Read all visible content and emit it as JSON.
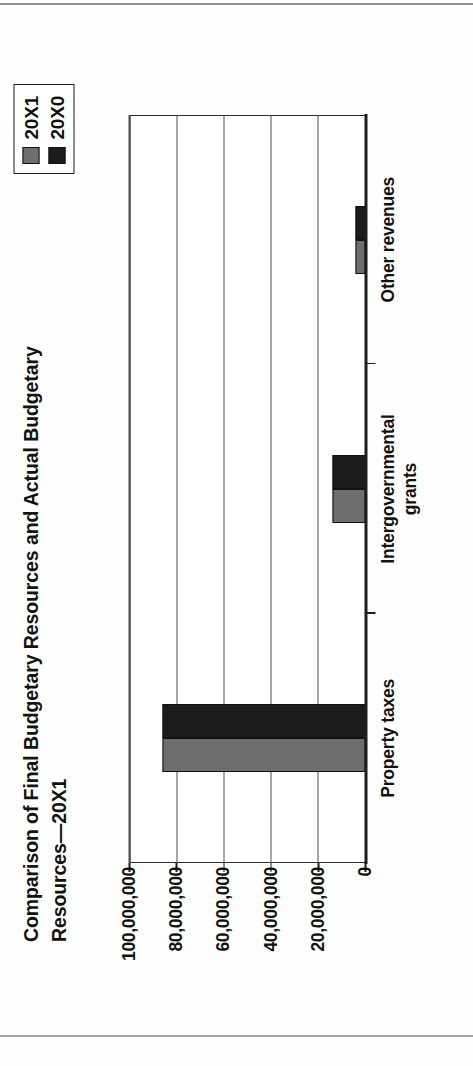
{
  "chart_data": {
    "type": "bar",
    "title_line1": "Comparison of Final Budgetary Resources and Actual Budgetary",
    "title_line2": "Resources—20X1",
    "orientation": "vertical-clustered",
    "categories": [
      "Property taxes",
      "Intergovernmental grants",
      "Other revenues"
    ],
    "category_label_lines": [
      [
        "Property taxes"
      ],
      [
        "Intergovernmental",
        "grants"
      ],
      [
        "Other revenues"
      ]
    ],
    "series": [
      {
        "name": "20X1",
        "color": "#6e6e6e",
        "values": [
          86000000,
          14200000,
          4300000
        ]
      },
      {
        "name": "20X0",
        "color": "#1c1c1c",
        "values": [
          86000000,
          14200000,
          4300000
        ]
      }
    ],
    "xlabel": "",
    "ylabel": "",
    "ylim": [
      0,
      100000000
    ],
    "ytick_values": [
      0,
      20000000,
      40000000,
      60000000,
      80000000,
      100000000
    ],
    "ytick_labels": [
      "0",
      "20,000,000",
      "40,000,000",
      "60,000,000",
      "80,000,000",
      "100,000,000"
    ],
    "grid": "horizontal-at-ticks",
    "legend": {
      "position": "top-right",
      "entries": [
        {
          "label": "20X1",
          "color": "#6e6e6e"
        },
        {
          "label": "20X0",
          "color": "#1c1c1c"
        }
      ]
    }
  }
}
